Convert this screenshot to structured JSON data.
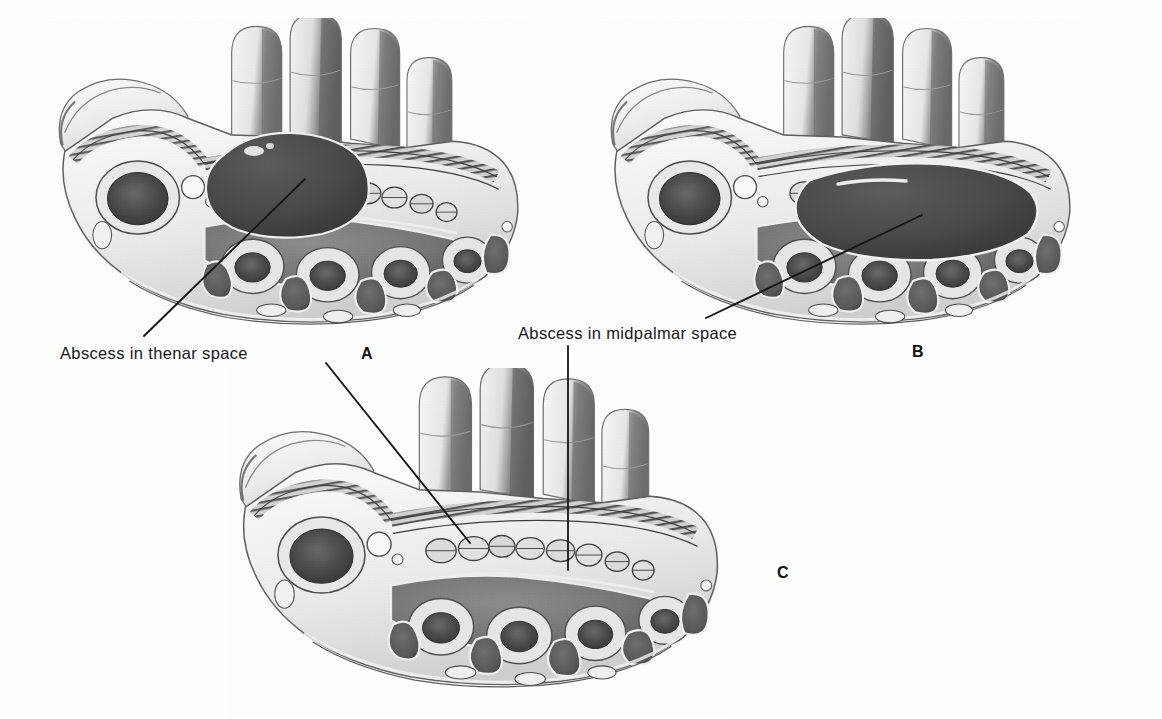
{
  "figure": {
    "kind": "anatomical-illustration",
    "style": "grayscale halftone textbook plate",
    "background_color": "#ffffff",
    "ink_color": "#17171a",
    "panel_count": 3
  },
  "labels": [
    {
      "id": "thenar",
      "text": "Abscess in thenar space",
      "x": 60,
      "y": 357,
      "leader": {
        "x1": 144,
        "y1": 336,
        "x2": 305,
        "y2": 179
      }
    },
    {
      "id": "midpalmar",
      "text": "Abscess in midpalmar space",
      "x": 518,
      "y": 337,
      "leader": {
        "x1": 706,
        "y1": 318,
        "x2": 922,
        "y2": 215
      }
    }
  ],
  "extra_leaders": [
    {
      "id": "thenar-to-panel-c",
      "x1": 326,
      "y1": 363,
      "x2": 470,
      "y2": 543
    },
    {
      "id": "midpalmar-to-panel-c",
      "x1": 568,
      "y1": 346,
      "x2": 568,
      "y2": 570
    }
  ],
  "panels": [
    {
      "letter": "A",
      "letter_x": 361,
      "letter_y": 360,
      "caption_label": "Abscess in thenar space",
      "finding": "large dark abscess filling the thenar space deep to the flexor tendons",
      "abscess_present": true,
      "abscess_location": "thenar space"
    },
    {
      "letter": "B",
      "letter_x": 912,
      "letter_y": 358,
      "caption_label": "Abscess in midpalmar space",
      "finding": "large dark abscess filling the midpalmar space beneath the flexor tendons",
      "abscess_present": true,
      "abscess_location": "midpalmar space"
    },
    {
      "letter": "C",
      "letter_x": 777,
      "letter_y": 579,
      "caption_label": "",
      "finding": "normal palmar cross section with intact thenar and midpalmar spaces",
      "abscess_present": false,
      "abscess_location": ""
    }
  ]
}
